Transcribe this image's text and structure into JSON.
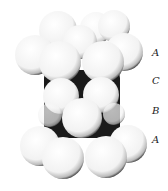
{
  "diagram": {
    "layer_labels": [
      {
        "text": "A",
        "x": 152,
        "y": 56
      },
      {
        "text": "C",
        "x": 152,
        "y": 84
      },
      {
        "text": "B",
        "x": 152,
        "y": 114
      },
      {
        "text": "A",
        "x": 152,
        "y": 143
      }
    ],
    "colors": {
      "sphere_fill": "#f7f7f7",
      "sphere_shadow": "#111111",
      "background": "#ffffff"
    }
  }
}
